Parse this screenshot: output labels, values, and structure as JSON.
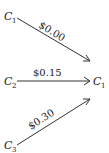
{
  "nodes": [
    {
      "id": "src1",
      "letter": "C",
      "subscript": "1"
    },
    {
      "id": "src2",
      "letter": "C",
      "subscript": "2"
    },
    {
      "id": "src3",
      "letter": "C",
      "subscript": "3"
    },
    {
      "id": "dst",
      "letter": "C",
      "subscript": "1"
    }
  ],
  "edges": [
    {
      "from": "src1",
      "to": "dst",
      "label": "$0.00"
    },
    {
      "from": "src2",
      "to": "dst",
      "label": "$0.15"
    },
    {
      "from": "src3",
      "to": "dst",
      "label": "$0.30"
    }
  ],
  "colors": {
    "line": "#333333",
    "text": "#222222",
    "background": "#ffffff"
  }
}
